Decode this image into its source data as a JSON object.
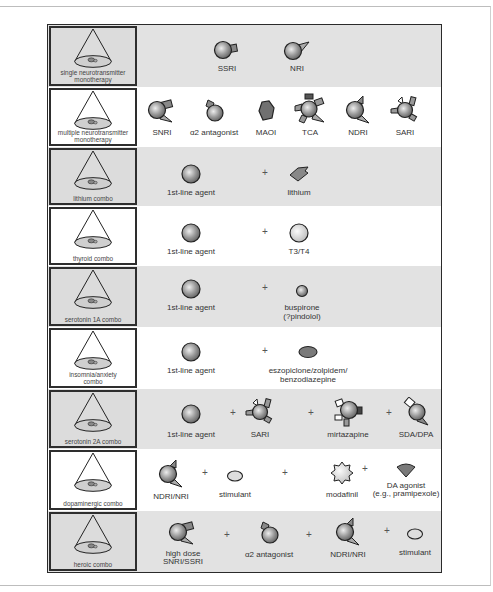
{
  "rows": [
    {
      "label": "single neurotransmitter monotherapy",
      "label_l1": "single neurotransmitter",
      "label_l2": "monotherapy",
      "bg": "gray",
      "items": [
        {
          "icon": "ssri-icon",
          "label": "SSRI"
        },
        {
          "icon": "nri-icon",
          "label": "NRI"
        }
      ]
    },
    {
      "label": "multiple neurotransmitter monotherapy",
      "label_l1": "multiple neurotransmitter",
      "label_l2": "monotherapy",
      "bg": "white",
      "items": [
        {
          "icon": "snri-icon",
          "label": "SNRI"
        },
        {
          "icon": "alpha2-antagonist-icon",
          "label": "2 antagonist",
          "prefix": "α"
        },
        {
          "icon": "maoi-icon",
          "label": "MAOI"
        },
        {
          "icon": "tca-icon",
          "label": "TCA"
        },
        {
          "icon": "ndri-icon",
          "label": "NDRI"
        },
        {
          "icon": "sari-icon",
          "label": "SARI"
        }
      ]
    },
    {
      "label": "lithium combo",
      "bg": "gray",
      "items": [
        {
          "icon": "first-line-agent-icon",
          "label": "1st-line agent"
        },
        {
          "icon": "lithium-icon",
          "label": "lithium"
        }
      ]
    },
    {
      "label": "thyroid combo",
      "bg": "white",
      "items": [
        {
          "icon": "first-line-agent-icon",
          "label": "1st-line agent"
        },
        {
          "icon": "t3-t4-icon",
          "label": "T3/T4"
        }
      ]
    },
    {
      "label": "serotonin 1A combo",
      "bg": "gray",
      "items": [
        {
          "icon": "first-line-agent-icon",
          "label": "1st-line agent"
        },
        {
          "icon": "buspirone-icon",
          "label": "buspirone",
          "label2": "(?pindolol)"
        }
      ]
    },
    {
      "label": "insomnia/anxiety combo",
      "label_l1": "insomnia/anxiety",
      "label_l2": "combo",
      "bg": "white",
      "items": [
        {
          "icon": "first-line-agent-icon",
          "label": "1st-line agent"
        },
        {
          "icon": "hypnotic-icon",
          "label": "eszopiclone/zolpidem/",
          "label2": "benzodiazepine"
        }
      ]
    },
    {
      "label": "serotonin 2A combo",
      "bg": "gray",
      "items": [
        {
          "icon": "first-line-agent-icon",
          "label": "1st-line agent"
        },
        {
          "icon": "sari-icon",
          "label": "SARI"
        },
        {
          "icon": "mirtazapine-icon",
          "label": "mirtazapine"
        },
        {
          "icon": "sda-dpa-icon",
          "label": "SDA/DPA"
        }
      ]
    },
    {
      "label": "dopaminergic combo",
      "bg": "white",
      "items": [
        {
          "icon": "ndri-icon",
          "label": "NDRI/NRI"
        },
        {
          "icon": "stimulant-icon",
          "label": "stimulant"
        },
        {
          "icon": "modafinil-icon",
          "label": "modafinil"
        },
        {
          "icon": "da-agonist-icon",
          "label": "DA agonist",
          "label2": "(e.g., pramipexole)"
        }
      ]
    },
    {
      "label": "heroic combo",
      "bg": "gray",
      "items": [
        {
          "icon": "snri-icon",
          "label": "high dose",
          "label2": "SNRI/SSRI"
        },
        {
          "icon": "alpha2-antagonist-icon",
          "label": "2 antagonist",
          "prefix": "α"
        },
        {
          "icon": "ndri-icon",
          "label": "NDRI/NRI"
        },
        {
          "icon": "stimulant-icon",
          "label": "stimulant"
        }
      ]
    }
  ],
  "plus": "+"
}
